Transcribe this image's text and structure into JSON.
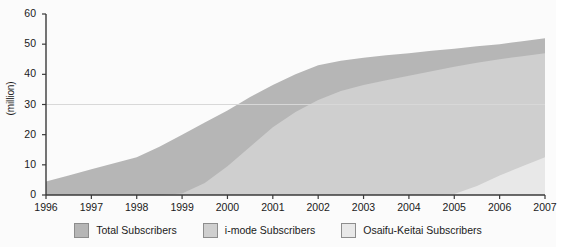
{
  "chart_data": {
    "type": "area",
    "stacked": true,
    "title": "",
    "subtitle": "",
    "xlabel": "",
    "ylabel": "(million)",
    "xlim": [
      1996,
      2007
    ],
    "ylim": [
      0,
      60
    ],
    "grid": "single horizontal gridline at y = 30",
    "gridline_values": [
      30
    ],
    "legend_position": "bottom-center",
    "x_tick_labels": [
      "1996",
      "1997",
      "1998",
      "1999",
      "2000",
      "2001",
      "2002",
      "2003",
      "2004",
      "2005",
      "2006",
      "2007"
    ],
    "y_tick_labels": [
      "0",
      "10",
      "20",
      "30",
      "40",
      "50",
      "60"
    ],
    "y_tick_values": [
      0,
      10,
      20,
      30,
      40,
      50,
      60
    ],
    "x": [
      1996,
      1996.5,
      1997,
      1997.5,
      1998,
      1998.5,
      1999,
      1999.5,
      2000,
      2000.5,
      2001,
      2001.5,
      2002,
      2002.5,
      2003,
      2003.5,
      2004,
      2004.5,
      2005,
      2005.5,
      2006,
      2006.5,
      2007
    ],
    "series": [
      {
        "name": "Total Subscribers",
        "color": "#b6b6b6",
        "values": [
          4.5,
          6.5,
          8.5,
          10.5,
          12.5,
          16.0,
          20.0,
          24.0,
          28.0,
          32.5,
          36.5,
          40.0,
          43.0,
          44.5,
          45.5,
          46.3,
          47.0,
          47.8,
          48.5,
          49.3,
          50.0,
          51.0,
          52.0
        ]
      },
      {
        "name": "i-mode Subscribers",
        "color": "#cfcfcf",
        "values": [
          0,
          0,
          0,
          0,
          0,
          0,
          0.5,
          4.0,
          9.5,
          16.0,
          22.5,
          27.5,
          31.5,
          34.5,
          36.5,
          38.0,
          39.5,
          41.0,
          42.5,
          43.8,
          45.0,
          46.0,
          47.0
        ]
      },
      {
        "name": "Osaifu-Keitai Subscribers",
        "color": "#e8e8e8",
        "values": [
          0,
          0,
          0,
          0,
          0,
          0,
          0,
          0,
          0,
          0,
          0,
          0,
          0,
          0,
          0,
          0,
          0,
          0,
          0.3,
          3.0,
          6.5,
          9.5,
          12.5
        ]
      }
    ]
  },
  "axis": {
    "y_label": "(million)"
  },
  "legend": {
    "items": [
      {
        "label": "Total Subscribers",
        "swatch": "#b6b6b6"
      },
      {
        "label": "i-mode Subscribers",
        "swatch": "#cfcfcf"
      },
      {
        "label": "Osaifu-Keitai Subscribers",
        "swatch": "#e8e8e8"
      }
    ]
  },
  "colors": {
    "total": "#b6b6b6",
    "imode": "#cfcfcf",
    "osaifu": "#e8e8e8",
    "axis": "#3a3a3a",
    "gridline": "#d8d8d8",
    "background": "#fbfbfb"
  }
}
